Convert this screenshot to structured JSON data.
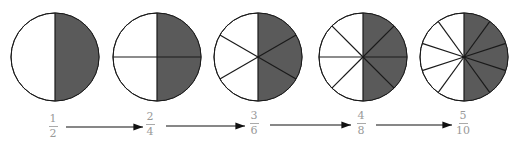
{
  "colors": {
    "shaded": "#5a5a5a",
    "unshaded": "#ffffff",
    "stroke": "#1a1a1a",
    "label": "#999999"
  },
  "circles": [
    {
      "numerator": "1",
      "denominator": "2",
      "parts": 2,
      "shaded": 1,
      "cx": 55
    },
    {
      "numerator": "2",
      "denominator": "4",
      "parts": 4,
      "shaded": 2,
      "cx": 157
    },
    {
      "numerator": "3",
      "denominator": "6",
      "parts": 6,
      "shaded": 3,
      "cx": 258
    },
    {
      "numerator": "4",
      "denominator": "8",
      "parts": 8,
      "shaded": 4,
      "cx": 363
    },
    {
      "numerator": "5",
      "denominator": "10",
      "parts": 10,
      "shaded": 5,
      "cx": 464
    }
  ],
  "arrows": [
    {
      "from": "1/2",
      "to": "2/4"
    },
    {
      "from": "2/4",
      "to": "3/6"
    },
    {
      "from": "3/6",
      "to": "4/8"
    },
    {
      "from": "4/8",
      "to": "5/10"
    }
  ]
}
